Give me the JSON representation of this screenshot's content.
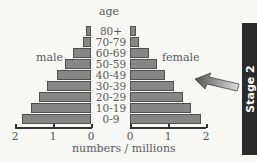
{
  "chart_data": {
    "type": "bar",
    "subtype": "population-pyramid",
    "title": "",
    "categories": [
      "80+",
      "70-79",
      "60-69",
      "50-59",
      "40-49",
      "30-39",
      "20-29",
      "10-19",
      "0-9"
    ],
    "series": [
      {
        "name": "male",
        "values": [
          0.13,
          0.21,
          0.47,
          0.68,
          0.89,
          1.16,
          1.37,
          1.58,
          1.82
        ]
      },
      {
        "name": "female",
        "values": [
          0.16,
          0.24,
          0.51,
          0.72,
          0.91,
          1.17,
          1.39,
          1.6,
          1.87
        ]
      }
    ],
    "ylabel": "age",
    "xlabel": "numbers / millions",
    "xticks_left": [
      "2",
      "1",
      "0"
    ],
    "xticks_right": [
      "0",
      "1",
      "2"
    ],
    "xlim": [
      0,
      2
    ],
    "grid": false,
    "bar_color": "#868686"
  },
  "labels": {
    "age": "age",
    "male": "male",
    "female": "female",
    "xlabel": "numbers / millions",
    "stage": "Stage 2"
  }
}
